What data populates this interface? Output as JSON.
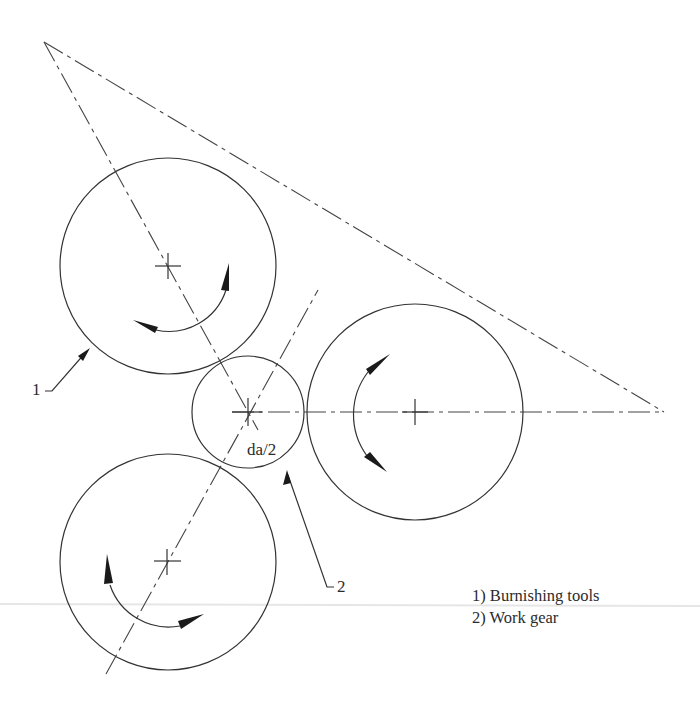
{
  "figure": {
    "type": "technical-diagram",
    "colors": {
      "line": "#333333",
      "arrow": "#1a1a1a",
      "background": "#ffffff",
      "separator": "#e6e6e6"
    }
  },
  "labels": {
    "callout_1": "1",
    "callout_2": "2",
    "dimension": "da/2"
  },
  "legend": {
    "items": [
      {
        "label": "1) Burnishing tools"
      },
      {
        "label": "2) Work gear"
      }
    ]
  },
  "geometry": {
    "work_gear": {
      "cx": 248,
      "cy": 412,
      "r": 56
    },
    "tools": [
      {
        "name": "tool-top-left",
        "cx": 168,
        "cy": 266,
        "r": 108,
        "rotation": "counterclockwise"
      },
      {
        "name": "tool-right",
        "cx": 415,
        "cy": 412,
        "r": 108,
        "rotation": "counterclockwise"
      },
      {
        "name": "tool-bottom-left",
        "cx": 168,
        "cy": 562,
        "r": 108,
        "rotation": "counterclockwise"
      }
    ],
    "triangle": {
      "points": [
        [
          44,
          42
        ],
        [
          664,
          412
        ],
        [
          248,
          412
        ]
      ]
    }
  }
}
